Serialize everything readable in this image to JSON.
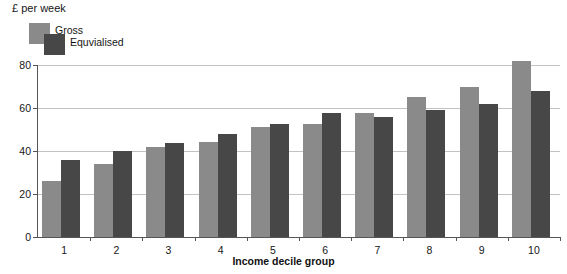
{
  "caption": {
    "unit_label": "£ per week"
  },
  "legend": {
    "position": "top-left",
    "entries": [
      {
        "label": "Gross",
        "color": "#8a8a8a"
      },
      {
        "label": "Equvialised",
        "color": "#474747"
      }
    ]
  },
  "axes": {
    "x_title": "Income decile group",
    "y_ticks": [
      "0",
      "20",
      "40",
      "60",
      "80"
    ]
  },
  "chart_data": {
    "type": "bar",
    "title": "",
    "subtitle": "",
    "xlabel": "Income decile group",
    "ylabel": "£ per week",
    "ylim": [
      0,
      80
    ],
    "yticks": [
      0,
      20,
      40,
      60,
      80
    ],
    "grid": true,
    "legend_position": "top-left",
    "categories": [
      "1",
      "2",
      "3",
      "4",
      "5",
      "6",
      "7",
      "8",
      "9",
      "10"
    ],
    "series": [
      {
        "name": "Gross",
        "color": "#8a8a8a",
        "values": [
          26,
          34,
          42,
          44,
          51,
          52.5,
          57.5,
          65,
          70,
          82
        ]
      },
      {
        "name": "Equvialised",
        "color": "#474747",
        "values": [
          36,
          40,
          43.5,
          48,
          52.5,
          57.5,
          56,
          59,
          62,
          68
        ]
      }
    ]
  }
}
